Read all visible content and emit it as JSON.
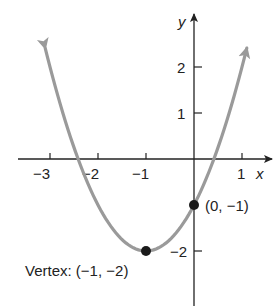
{
  "chart_data": {
    "type": "line",
    "title": "",
    "function": "f(x) = (x + 1)^2 - 2",
    "xlabel": "x",
    "ylabel": "y",
    "xlim": [
      -3.2,
      1.6
    ],
    "ylim": [
      -3.2,
      3.1
    ],
    "x_ticks": [
      -3,
      -2,
      -1,
      1
    ],
    "x_tick_labels": [
      "−3",
      "−2",
      "−1",
      "1"
    ],
    "y_ticks": [
      2,
      1,
      -2
    ],
    "y_tick_labels": [
      "2",
      "1",
      "−2"
    ],
    "grid": false,
    "series": [
      {
        "name": "parabola",
        "color": "#9a9a9a",
        "x": [
          -3.1,
          -3,
          -2.5,
          -2,
          -1.5,
          -1,
          -0.5,
          0,
          0.5,
          1,
          1.1
        ],
        "values": [
          2.41,
          2,
          0.25,
          -1,
          -1.75,
          -2,
          -1.75,
          -1,
          0.25,
          2,
          2.41
        ]
      }
    ],
    "points": [
      {
        "x": -1,
        "y": -2,
        "label": "Vertex: (−1, −2)"
      },
      {
        "x": 0,
        "y": -1,
        "label": "(0, −1)"
      }
    ],
    "annotations": [
      "Vertex: (−1, −2)",
      "(0, −1)"
    ]
  },
  "labels": {
    "x_axis": "x",
    "y_axis": "y",
    "xt_m3": "−3",
    "xt_m2": "−2",
    "xt_m1": "−1",
    "xt_1": "1",
    "yt_2": "2",
    "yt_1": "1",
    "yt_m2": "−2",
    "vertex": "Vertex: (−1, −2)",
    "intercept": "(0, −1)"
  }
}
